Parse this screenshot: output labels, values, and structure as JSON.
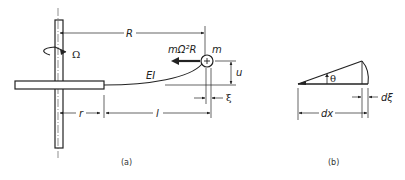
{
  "figure": {
    "panel_a": {
      "caption": "(a)",
      "labels": {
        "R": "R",
        "omega": "Ω",
        "force": "mΩ²R",
        "mass": "m",
        "stiffness": "EI",
        "u": "u",
        "xi": "ξ",
        "r": "r",
        "l": "l"
      }
    },
    "panel_b": {
      "caption": "(b)",
      "labels": {
        "theta": "θ",
        "dxi": "dξ",
        "dx": "dx"
      }
    }
  }
}
